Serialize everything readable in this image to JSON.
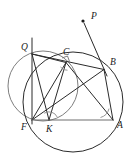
{
  "figure": {
    "background_color": "#ffffff",
    "stroke_color": "#2b2b2b",
    "light_stroke_color": "#7a7a7a",
    "label_color": "#1a1a1a",
    "width": 130,
    "height": 162
  },
  "points": [
    {
      "id": "P",
      "label": "P",
      "x": 83.0,
      "y": 21.0,
      "label_x": 91.0,
      "label_y": 18.5,
      "dot": true
    },
    {
      "id": "Q",
      "label": "Q",
      "x": 32.0,
      "y": 54.0,
      "label_x": 21.0,
      "label_y": 50.0,
      "dot": false
    },
    {
      "id": "C",
      "label": "C",
      "x": 66.0,
      "y": 62.5,
      "label_x": 63.0,
      "label_y": 55.0,
      "dot": false
    },
    {
      "id": "B",
      "label": "B",
      "x": 104.0,
      "y": 69.5,
      "label_x": 110.0,
      "label_y": 65.0,
      "dot": false
    },
    {
      "id": "F",
      "label": "F",
      "x": 32.0,
      "y": 120.0,
      "label_x": 21.0,
      "label_y": 130.0,
      "dot": false
    },
    {
      "id": "K",
      "label": "K",
      "x": 49.0,
      "y": 120.0,
      "label_x": 46.0,
      "label_y": 132.0,
      "dot": false
    },
    {
      "id": "A",
      "label": "A",
      "x": 113.0,
      "y": 120.0,
      "label_x": 117.0,
      "label_y": 128.0,
      "dot": false
    }
  ],
  "circles": [
    {
      "id": "small-circle",
      "cx": 43.0,
      "cy": 86.0,
      "r": 35.0,
      "stroke": "#6e6e6e",
      "width": 0.9
    },
    {
      "id": "large-circle",
      "cx": 73.0,
      "cy": 102.0,
      "r": 50.0,
      "stroke": "#2b2b2b",
      "width": 1.0
    }
  ],
  "segments": [
    {
      "id": "line-QF-vertical",
      "from": "32,38",
      "to": "32,124",
      "stroke": "#2b2b2b",
      "width": 1.0
    },
    {
      "id": "line-PB",
      "from": "84,23",
      "to": "107,76",
      "stroke": "#2b2b2b",
      "width": 1.0
    },
    {
      "id": "chord-QC",
      "from": "32,54",
      "to": "66,62.5",
      "stroke": "#2b2b2b",
      "width": 1.0
    },
    {
      "id": "chord-QB",
      "from": "32,54",
      "to": "104,69.5",
      "stroke": "#2b2b2b",
      "width": 1.0
    },
    {
      "id": "chord-QK",
      "from": "32,54",
      "to": "49,120",
      "stroke": "#2b2b2b",
      "width": 1.0
    },
    {
      "id": "chord-FC",
      "from": "32,120",
      "to": "66,62.5",
      "stroke": "#2b2b2b",
      "width": 1.0
    },
    {
      "id": "chord-FB",
      "from": "32,120",
      "to": "104,69.5",
      "stroke": "#2b2b2b",
      "width": 1.0
    },
    {
      "id": "chord-FA",
      "from": "32,120",
      "to": "113,120",
      "stroke": "#6e6e6e",
      "width": 1.1
    },
    {
      "id": "chord-CK",
      "from": "66,62.5",
      "to": "49,120",
      "stroke": "#2b2b2b",
      "width": 1.0
    },
    {
      "id": "chord-CA",
      "from": "66,62.5",
      "to": "113,120",
      "stroke": "#2b2b2b",
      "width": 1.0
    },
    {
      "id": "chord-BA",
      "from": "104,69.5",
      "to": "113,120",
      "stroke": "#2b2b2b",
      "width": 1.0
    }
  ],
  "angle_marks": [
    {
      "id": "angle-at-K",
      "type": "arc",
      "d": "M 44.2,113.2 A 9,9 0 0 1 57.2,117.0",
      "stroke": "#8a8a8a"
    },
    {
      "id": "angle-at-A",
      "type": "arc",
      "d": "M 100.5,117.5 A 12,12 0 0 0 109.0,108.6",
      "stroke": "#8a8a8a"
    },
    {
      "id": "right-angle-at-C",
      "type": "square",
      "d": "M 62.0,58.0 L 67.5,56.0 L 69.5,61.5",
      "stroke": "#6e6e6e"
    },
    {
      "id": "angle-at-C-arc",
      "type": "arc",
      "d": "M 60.5,67.0 A 7.5,7.5 0 0 0 67.5,70.2",
      "stroke": "#8a8a8a"
    }
  ]
}
